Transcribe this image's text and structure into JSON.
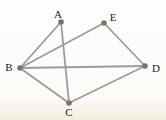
{
  "diagram": {
    "type": "graph",
    "colors": {
      "background": "#fcfbf8",
      "background_bottom_tint": "#f3eedd",
      "edge": "#9b9b9b",
      "node": "#737373",
      "label": "#1c1c1c"
    },
    "style": {
      "edge_width": 1.8,
      "node_radius": 2.8,
      "label_font_size": 11
    },
    "nodes": [
      {
        "id": "A",
        "label": "A",
        "x": 61,
        "y": 22,
        "label_x": 58,
        "label_y": 14
      },
      {
        "id": "B",
        "label": "B",
        "x": 20,
        "y": 68,
        "label_x": 9,
        "label_y": 67
      },
      {
        "id": "C",
        "label": "C",
        "x": 69,
        "y": 103,
        "label_x": 69,
        "label_y": 112
      },
      {
        "id": "D",
        "label": "D",
        "x": 145,
        "y": 66,
        "label_x": 156,
        "label_y": 68
      },
      {
        "id": "E",
        "label": "E",
        "x": 104,
        "y": 23,
        "label_x": 113,
        "label_y": 17
      }
    ],
    "edges": [
      {
        "from": "A",
        "to": "B"
      },
      {
        "from": "A",
        "to": "C"
      },
      {
        "from": "B",
        "to": "C"
      },
      {
        "from": "B",
        "to": "D"
      },
      {
        "from": "B",
        "to": "E"
      },
      {
        "from": "C",
        "to": "D"
      },
      {
        "from": "D",
        "to": "E"
      }
    ]
  }
}
